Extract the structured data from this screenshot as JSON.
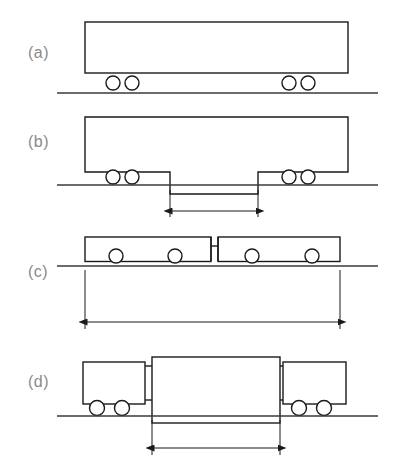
{
  "figure": {
    "type": "technical-line-diagram",
    "width": 394,
    "height": 468,
    "background_color": "#ffffff",
    "line_color": "#1a1a1a",
    "ground_color": "#3a3a3a",
    "label_color": "#8a8a8a"
  },
  "panels": [
    {
      "id": "a",
      "label": "(a)",
      "label_x": 28,
      "label_y": 58,
      "description": "single rigid body on four wheels, flat floor",
      "ground": {
        "x1": 57,
        "y": 93,
        "x2": 378
      },
      "bodies": [
        {
          "name": "main-body",
          "x": 85,
          "y": 22,
          "width": 263,
          "height": 51
        }
      ],
      "wheels": [
        {
          "cx": 113,
          "cy": 83,
          "r": 7
        },
        {
          "cx": 132,
          "cy": 83,
          "r": 7
        },
        {
          "cx": 289,
          "cy": 83,
          "r": 7
        },
        {
          "cx": 308,
          "cy": 83,
          "r": 7
        }
      ],
      "joints": [],
      "dimension": null
    },
    {
      "id": "b",
      "label": "(b)",
      "label_x": 28,
      "label_y": 147,
      "description": "single body with lowered centre floor section between bogies",
      "ground": {
        "x1": 57,
        "y": 185,
        "x2": 378
      },
      "bodies": [],
      "profile_points": "85,117 348,117 348,172 258,172 258,194 170,194 170,172 85,172",
      "wheels": [
        {
          "cx": 113,
          "cy": 177,
          "r": 7
        },
        {
          "cx": 132,
          "cy": 177,
          "r": 7
        },
        {
          "cx": 289,
          "cy": 177,
          "r": 7
        },
        {
          "cx": 308,
          "cy": 177,
          "r": 7
        }
      ],
      "joints": [],
      "dimension": {
        "name": "low-floor-length",
        "x1": 170,
        "x2": 258,
        "y": 211,
        "ext_top": 190,
        "ext_bottom": 217
      }
    },
    {
      "id": "c",
      "label": "(c)",
      "label_x": 28,
      "label_y": 277,
      "description": "two articulated body sections joined by a narrow coupling, four wheels",
      "ground": {
        "x1": 57,
        "y": 266,
        "x2": 378
      },
      "bodies": [
        {
          "name": "body-section-left",
          "x": 85,
          "y": 237,
          "width": 126,
          "height": 24
        },
        {
          "name": "body-section-right",
          "x": 218,
          "y": 237,
          "width": 122,
          "height": 24
        }
      ],
      "body_full": [
        {
          "name": "body-section-left",
          "x": 85,
          "y": 237,
          "width": 126,
          "height": 82
        },
        {
          "name": "body-section-right",
          "x": 218,
          "y": 237,
          "width": 122,
          "height": 82
        }
      ],
      "wheels": [
        {
          "cx": 116,
          "cy": 258,
          "r": 7
        },
        {
          "cx": 175,
          "cy": 258,
          "r": 7
        },
        {
          "cx": 252,
          "cy": 258,
          "r": 7
        },
        {
          "cx": 312,
          "cy": 258,
          "r": 7
        }
      ],
      "joint": {
        "x1": 211,
        "x2": 218,
        "y_top": 237,
        "y_bottom": 259,
        "bar_y": 246
      },
      "dimension": {
        "name": "overall-vehicle-length",
        "x1": 85,
        "x2": 340,
        "y": 322,
        "ext_top": 270,
        "ext_bottom": 329
      }
    },
    {
      "id": "d",
      "label": "(d)",
      "label_x": 28,
      "label_y": 387,
      "description": "three-section vehicle: two end bodies over bogies plus a lowered suspended centre body",
      "ground": {
        "x1": 57,
        "y": 416,
        "x2": 378
      },
      "bodies": [
        {
          "name": "end-body-left",
          "x": 83,
          "y": 362,
          "width": 62,
          "height": 42
        },
        {
          "name": "centre-body",
          "x": 152,
          "y": 357,
          "width": 128,
          "height": 66
        },
        {
          "name": "end-body-right",
          "x": 283,
          "y": 362,
          "width": 63,
          "height": 42
        }
      ],
      "wheels": [
        {
          "cx": 97,
          "cy": 408,
          "r": 7
        },
        {
          "cx": 122,
          "cy": 408,
          "r": 7
        },
        {
          "cx": 299,
          "cy": 408,
          "r": 7
        },
        {
          "cx": 324,
          "cy": 408,
          "r": 7
        }
      ],
      "joints": [
        {
          "name": "coupling-left",
          "x1": 145,
          "x2": 152,
          "y_top": 366,
          "y_bottom": 400
        },
        {
          "name": "coupling-right",
          "x1": 280,
          "x2": 283,
          "y_top": 366,
          "y_bottom": 400
        }
      ],
      "dimension": {
        "name": "centre-body-length",
        "x1": 152,
        "x2": 280,
        "y": 448,
        "ext_top": 420,
        "ext_bottom": 455
      }
    }
  ]
}
